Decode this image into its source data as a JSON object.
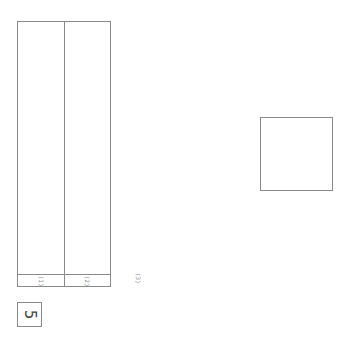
{
  "sheet": {
    "question_number": "5",
    "answer_columns": [
      {
        "label": "(1)"
      },
      {
        "label": "(2)"
      }
    ],
    "extra_label": "(3)"
  }
}
